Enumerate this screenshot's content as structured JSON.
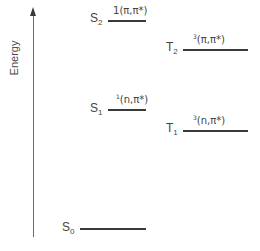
{
  "diagram": {
    "type": "jablonski-energy-level-diagram",
    "axis": {
      "label": "Energy",
      "direction": "up"
    },
    "levels": [
      {
        "id": "S2",
        "letter": "S",
        "subscript": "2",
        "orbital_prefix": "1",
        "orbital": "(π,π*)",
        "column": "singlet"
      },
      {
        "id": "T2",
        "letter": "T",
        "subscript": "2",
        "orbital_prefix": "3",
        "orbital": "(π,π*)",
        "column": "triplet"
      },
      {
        "id": "S1",
        "letter": "S",
        "subscript": "1",
        "orbital_prefix": "1",
        "orbital": "(n,π*)",
        "column": "singlet"
      },
      {
        "id": "T1",
        "letter": "T",
        "subscript": "1",
        "orbital_prefix": "3",
        "orbital": "(n,π*)",
        "column": "triplet"
      },
      {
        "id": "S0",
        "letter": "S",
        "subscript": "0",
        "orbital_prefix": "",
        "orbital": "",
        "column": "singlet"
      }
    ],
    "colors": {
      "line": "#3a3a3a",
      "text": "#444444",
      "axis": "#6a6a6a",
      "background": "#ffffff"
    }
  }
}
